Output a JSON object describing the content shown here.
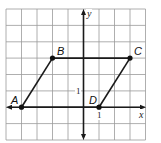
{
  "diagram": {
    "type": "coordinate-plane-parallelogram",
    "axes": {
      "x_label": "x",
      "y_label": "y",
      "unit_tick_x": "1",
      "unit_tick_y": "1"
    },
    "grid": {
      "x_min": -5,
      "x_max": 4,
      "y_min": -2,
      "y_max": 6
    },
    "points": [
      {
        "name": "A",
        "x": -4,
        "y": 0
      },
      {
        "name": "B",
        "x": -2,
        "y": 3
      },
      {
        "name": "C",
        "x": 3,
        "y": 3
      },
      {
        "name": "D",
        "x": 1,
        "y": 0
      }
    ],
    "segments": [
      [
        "A",
        "B"
      ],
      [
        "B",
        "C"
      ],
      [
        "C",
        "D"
      ],
      [
        "D",
        "A"
      ]
    ],
    "colors": {
      "grid": "#9a9a9a",
      "ink": "#1a1a1a",
      "background": "#ffffff"
    }
  }
}
